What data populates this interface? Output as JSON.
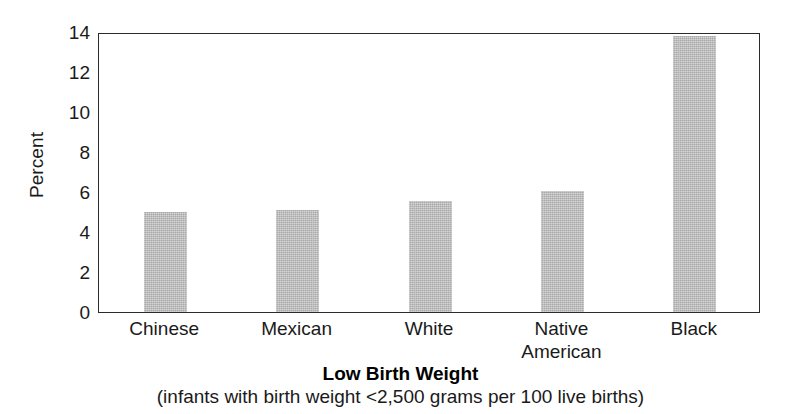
{
  "chart_data": {
    "type": "bar",
    "title": "Low Birth Weight",
    "subtitle": "(infants with birth weight <2,500 grams per 100 live births)",
    "xlabel": "",
    "ylabel": "Percent",
    "categories": [
      "Chinese",
      "Mexican",
      "White",
      "Native American",
      "Black"
    ],
    "values": [
      5.0,
      5.1,
      5.55,
      6.05,
      13.8
    ],
    "ylim": [
      0,
      14
    ],
    "yticks": [
      0,
      2,
      4,
      6,
      8,
      10,
      12,
      14
    ],
    "ytick_labels": [
      "0",
      "2",
      "4",
      "6",
      "8",
      "10",
      "12",
      "14"
    ],
    "grid": false,
    "legend": false,
    "bar_color": "#a9a9a9",
    "axis_color": "#2b2b2b"
  },
  "axis": {
    "y_title": "Percent"
  },
  "categories": [
    {
      "line1": "Chinese",
      "line2": ""
    },
    {
      "line1": "Mexican",
      "line2": ""
    },
    {
      "line1": "White",
      "line2": ""
    },
    {
      "line1": "Native",
      "line2": "American"
    },
    {
      "line1": "Black",
      "line2": ""
    }
  ],
  "caption": {
    "title": "Low Birth Weight",
    "subtitle": "(infants with birth weight <2,500 grams per 100 live births)"
  }
}
